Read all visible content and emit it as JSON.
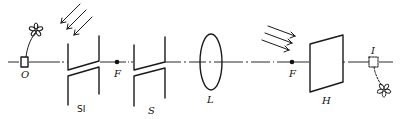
{
  "diagram": {
    "type": "optical-bench-schematic",
    "colors": {
      "line": "#1a1a1a",
      "background": "#ffffff"
    },
    "optical_axis": {
      "y": 62,
      "x_start": 8,
      "x_end": 393
    },
    "components": [
      {
        "id": "O",
        "label": "O",
        "kind": "object-box",
        "x": 24
      },
      {
        "id": "SI",
        "label": "SI",
        "kind": "slit-pair",
        "x": 82
      },
      {
        "id": "F1",
        "label": "F",
        "kind": "focal-point",
        "x": 117
      },
      {
        "id": "S",
        "label": "S",
        "kind": "slit-pair",
        "x": 153
      },
      {
        "id": "L",
        "label": "L",
        "kind": "lens",
        "x": 211
      },
      {
        "id": "F2",
        "label": "F",
        "kind": "focal-point",
        "x": 292
      },
      {
        "id": "H",
        "label": "H",
        "kind": "screen-plate",
        "x": 325
      },
      {
        "id": "I",
        "label": "I",
        "kind": "image-box",
        "x": 374
      }
    ],
    "light_rays": [
      {
        "id": "rays-left",
        "count": 3,
        "direction": "down-left"
      },
      {
        "id": "rays-right",
        "count": 3,
        "direction": "down-right"
      }
    ],
    "labels": {
      "O": "O",
      "SI": "SI",
      "F1": "F",
      "S": "S",
      "L": "L",
      "F2": "F",
      "H": "H",
      "I": "I"
    }
  }
}
